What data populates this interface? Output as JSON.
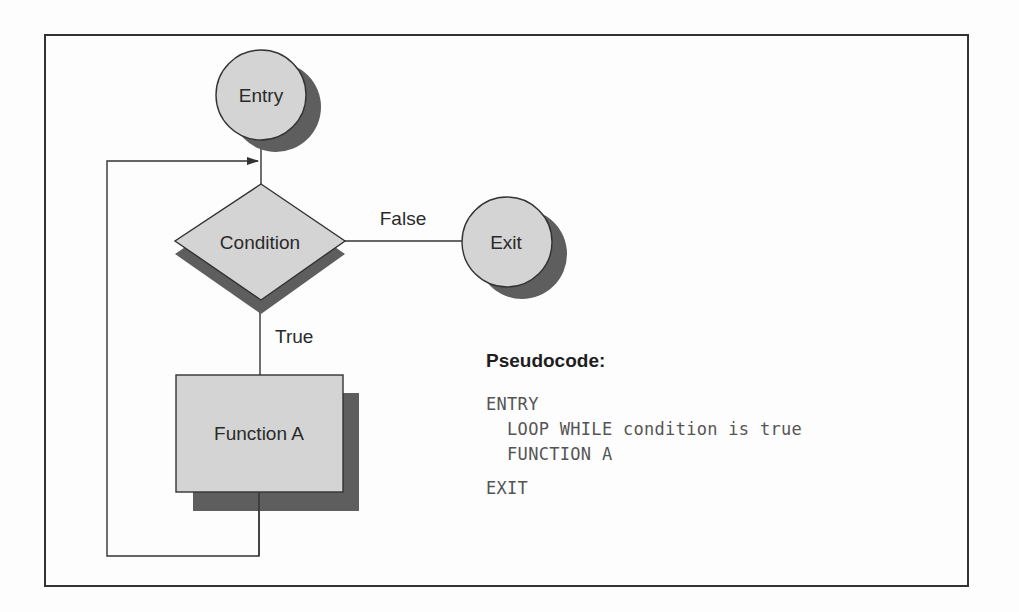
{
  "colors": {
    "shape_fill": "#d4d4d4",
    "shadow": "#5e5e5e",
    "stroke": "#333333",
    "frame": "#333333",
    "background": "#fdfdfd"
  },
  "flowchart": {
    "entry": {
      "label": "Entry"
    },
    "condition": {
      "label": "Condition"
    },
    "exit": {
      "label": "Exit"
    },
    "function_a": {
      "label": "Function A"
    },
    "edges": {
      "false_label": "False",
      "true_label": "True"
    }
  },
  "pseudocode": {
    "heading": "Pseudocode:",
    "lines": [
      "ENTRY",
      "  LOOP WHILE condition is true",
      "  FUNCTION A",
      "EXIT"
    ]
  }
}
